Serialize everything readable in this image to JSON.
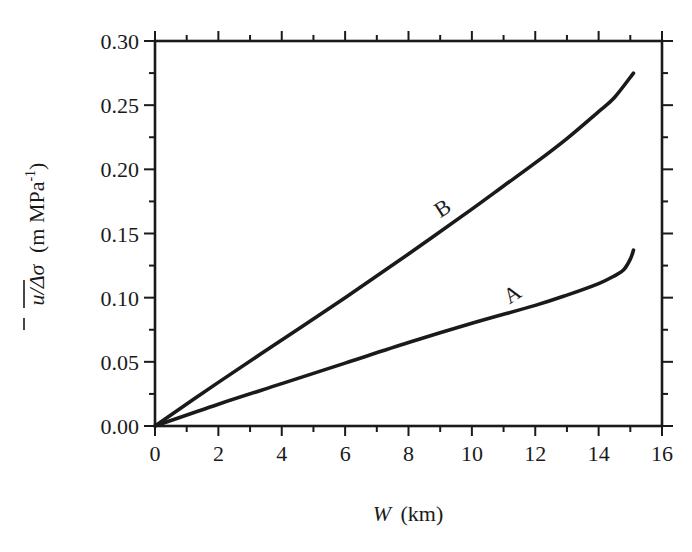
{
  "chart_data": {
    "type": "line",
    "title": "",
    "xlabel": "W (km)",
    "xlabel_var": "W",
    "xlabel_unit": "(km)",
    "ylabel": "ū/Δσ̄ (m MPa⁻¹)",
    "ylabel_var": "u/Δσ",
    "ylabel_unit": "(m MPa",
    "ylabel_exp": "-1",
    "ylabel_close": ")",
    "xlim": [
      0,
      16
    ],
    "ylim": [
      0.0,
      0.3
    ],
    "xticks": [
      "0",
      "2",
      "4",
      "6",
      "8",
      "10",
      "12",
      "14",
      "16"
    ],
    "yticks": [
      "0.00",
      "0.05",
      "0.10",
      "0.15",
      "0.20",
      "0.25",
      "0.30"
    ],
    "grid": false,
    "legend": "inline labels on curves",
    "series": [
      {
        "name": "A",
        "x": [
          0,
          2,
          4,
          6,
          8,
          10,
          12,
          13,
          14,
          14.5,
          14.8,
          15.0,
          15.1
        ],
        "values": [
          0,
          0.017,
          0.033,
          0.049,
          0.065,
          0.08,
          0.094,
          0.102,
          0.111,
          0.117,
          0.122,
          0.13,
          0.137
        ]
      },
      {
        "name": "B",
        "x": [
          0,
          2,
          4,
          6,
          8,
          10,
          11,
          12,
          13,
          14,
          14.5,
          15.1
        ],
        "values": [
          0,
          0.034,
          0.067,
          0.1,
          0.134,
          0.169,
          0.187,
          0.205,
          0.224,
          0.245,
          0.256,
          0.275
        ]
      }
    ],
    "annotations": [
      {
        "text": "B",
        "x": 9.2,
        "y": 0.165
      },
      {
        "text": "A",
        "x": 11.4,
        "y": 0.098
      }
    ]
  }
}
